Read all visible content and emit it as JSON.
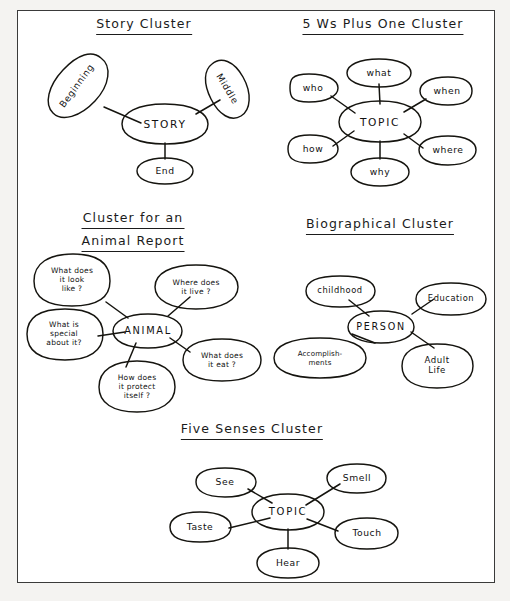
{
  "page": {
    "background_color": "#f4f3f1",
    "sheet_color": "#ffffff",
    "border_color": "#3a3a3a",
    "ink_color": "#15140f"
  },
  "clusters": [
    {
      "id": "story-cluster",
      "heading_lines": [
        "Story  Cluster"
      ],
      "center": {
        "label": "STORY"
      },
      "nodes": [
        {
          "label": "Beginning"
        },
        {
          "label": "Middle"
        },
        {
          "label": "End"
        }
      ]
    },
    {
      "id": "five-ws-plus-one-cluster",
      "heading_lines": [
        "5 Ws  Plus  One  Cluster"
      ],
      "center": {
        "label": "TOPIC"
      },
      "nodes": [
        {
          "label": "what"
        },
        {
          "label": "who"
        },
        {
          "label": "when"
        },
        {
          "label": "how"
        },
        {
          "label": "where"
        },
        {
          "label": "why"
        }
      ]
    },
    {
      "id": "animal-report-cluster",
      "heading_lines": [
        "Cluster  for  an",
        "Animal  Report"
      ],
      "center": {
        "label": "ANIMAL"
      },
      "nodes": [
        {
          "label": "What does\nit look\nlike ?"
        },
        {
          "label": "Where does\nit live ?"
        },
        {
          "label": "What is\nspecial\nabout it?"
        },
        {
          "label": "What does\nit eat ?"
        },
        {
          "label": "How does\nit protect\nitself ?"
        }
      ]
    },
    {
      "id": "biographical-cluster",
      "heading_lines": [
        "Biographical  Cluster"
      ],
      "center": {
        "label": "PERSON"
      },
      "nodes": [
        {
          "label": "childhood"
        },
        {
          "label": "Education"
        },
        {
          "label": "Accomplish-\nments"
        },
        {
          "label": "Adult\nLife"
        }
      ]
    },
    {
      "id": "five-senses-cluster",
      "heading_lines": [
        "Five  Senses  Cluster"
      ],
      "center": {
        "label": "TOPIC"
      },
      "nodes": [
        {
          "label": "See"
        },
        {
          "label": "Smell"
        },
        {
          "label": "Taste"
        },
        {
          "label": "Touch"
        },
        {
          "label": "Hear"
        }
      ]
    }
  ]
}
